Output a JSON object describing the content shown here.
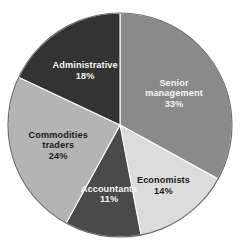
{
  "chart_data": {
    "type": "pie",
    "title": "",
    "subtitle": "",
    "xlabel": "",
    "ylabel": "",
    "legend_position": "none",
    "grid": false,
    "labels_inside_slices": true,
    "units": "%",
    "start_angle_deg": 0,
    "direction": "clockwise",
    "categories": [
      "Senior management",
      "Economists",
      "Accountants",
      "Commodities traders",
      "Administrative"
    ],
    "values": [
      33,
      14,
      11,
      24,
      18
    ],
    "slices": [
      {
        "label": "Senior management",
        "label_line1": "Senior",
        "label_line2": "management",
        "value": 33,
        "value_text": "33%",
        "color": "#8a8a8a",
        "text_color": "light"
      },
      {
        "label": "Economists",
        "label_line1": "Economists",
        "label_line2": "",
        "value": 14,
        "value_text": "14%",
        "color": "#dcdcdc",
        "text_color": "dark"
      },
      {
        "label": "Accountants",
        "label_line1": "Accountants",
        "label_line2": "",
        "value": 11,
        "value_text": "11%",
        "color": "#4a4a4a",
        "text_color": "light"
      },
      {
        "label": "Commodities traders",
        "label_line1": "Commodities",
        "label_line2": "traders",
        "value": 24,
        "value_text": "24%",
        "color": "#b4b4b4",
        "text_color": "dark"
      },
      {
        "label": "Administrative",
        "label_line1": "Administrative",
        "label_line2": "",
        "value": 18,
        "value_text": "18%",
        "color": "#333333",
        "text_color": "light"
      }
    ],
    "geometry": {
      "center_x": 120,
      "center_y": 125,
      "radius": 112
    },
    "background_color": "#ffffff",
    "outline_color": "#6f6f6f"
  }
}
